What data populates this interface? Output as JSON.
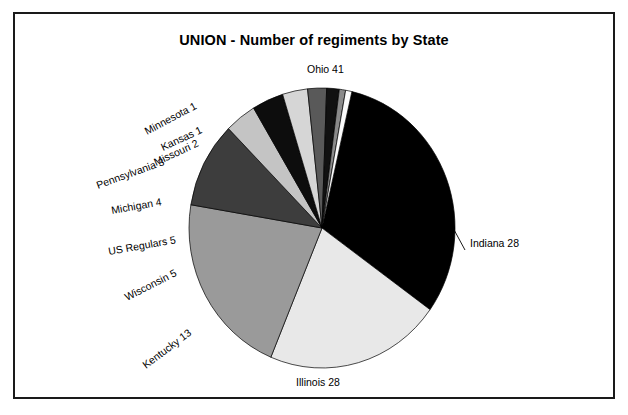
{
  "chart_data": {
    "type": "pie",
    "title": "UNION - Number of regiments by State",
    "xlabel": "",
    "ylabel": "",
    "total": 131,
    "units": "regiments",
    "legend": "none",
    "grid": false,
    "labels_show_value": true,
    "categories": [
      "Ohio",
      "Indiana",
      "Illinois",
      "Kentucky",
      "Wisconsin",
      "US Regulars",
      "Michigan",
      "Pennsylvania",
      "Missouri",
      "Kansas",
      "Minnesota"
    ],
    "values": [
      41,
      28,
      28,
      13,
      5,
      5,
      4,
      3,
      2,
      1,
      1
    ],
    "slices": [
      {
        "label": "Ohio 41",
        "name": "Ohio",
        "value": 41,
        "fill": "#000000",
        "label_x": 292,
        "label_y": 59,
        "anchor": "start",
        "rotate": 0,
        "leader": null
      },
      {
        "label": "Indiana 28",
        "name": "Indiana",
        "value": 28,
        "fill": "#e8e8e8",
        "label_x": 455,
        "label_y": 233,
        "anchor": "start",
        "rotate": 0,
        "leader": {
          "x1": 437,
          "y1": 212,
          "x2": 450,
          "y2": 236
        }
      },
      {
        "label": "Illinois 28",
        "name": "Illinois",
        "value": 28,
        "fill": "#9a9a9a",
        "label_x": 303,
        "label_y": 372,
        "anchor": "middle",
        "rotate": 0,
        "leader": null
      },
      {
        "label": "Kentucky 13",
        "name": "Kentucky",
        "value": 13,
        "fill": "#3d3d3d",
        "label_x": 131,
        "label_y": 355,
        "anchor": "start",
        "rotate": -37,
        "leader": null
      },
      {
        "label": "Wisconsin 5",
        "name": "Wisconsin",
        "value": 5,
        "fill": "#c4c4c4",
        "label_x": 112,
        "label_y": 287,
        "anchor": "start",
        "rotate": -27,
        "leader": null
      },
      {
        "label": "US Regulars 5",
        "name": "US Regulars",
        "value": 5,
        "fill": "#0d0d0d",
        "label_x": 94,
        "label_y": 241,
        "anchor": "start",
        "rotate": -10,
        "leader": null
      },
      {
        "label": "Michigan 4",
        "name": "Michigan",
        "value": 4,
        "fill": "#d6d6d6",
        "label_x": 97,
        "label_y": 200,
        "anchor": "start",
        "rotate": -10,
        "leader": null
      },
      {
        "label": "Pennsylvania 3",
        "name": "Pennsylvania",
        "value": 3,
        "fill": "#595959",
        "label_x": 83,
        "label_y": 175,
        "anchor": "start",
        "rotate": -20,
        "leader": null
      },
      {
        "label": "Missouri 2",
        "name": "Missouri",
        "value": 2,
        "fill": "#111111",
        "label_x": 141,
        "label_y": 152,
        "anchor": "start",
        "rotate": -25,
        "leader": null
      },
      {
        "label": "Kansas 1",
        "name": "Kansas",
        "value": 1,
        "fill": "#8a8a8a",
        "label_x": 148,
        "label_y": 137,
        "anchor": "start",
        "rotate": -25,
        "leader": null
      },
      {
        "label": "Minnesota 1",
        "name": "Minnesota",
        "value": 1,
        "fill": "#fbfbfb",
        "label_x": 132,
        "label_y": 121,
        "anchor": "start",
        "rotate": -28,
        "leader": null
      }
    ],
    "geometry": {
      "center_x": 307,
      "center_y": 214,
      "radius_x": 133,
      "radius_y": 140,
      "start_angle_deg": -77
    }
  }
}
